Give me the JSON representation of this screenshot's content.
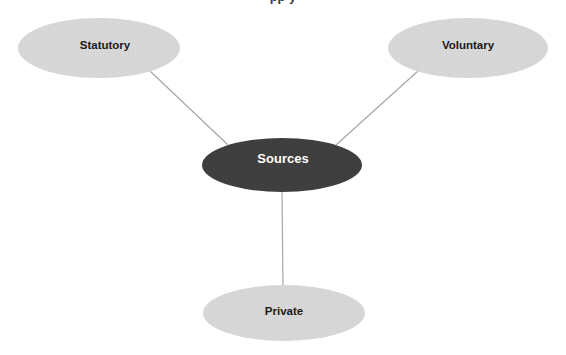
{
  "diagram": {
    "type": "hub-and-spoke",
    "background_color": "#ffffff",
    "clipped_title": "pp y",
    "center_node": {
      "label": "Sources",
      "fill": "#404040",
      "text_color": "#ffffff",
      "cx": 282,
      "cy": 165,
      "rx": 80,
      "ry": 27
    },
    "branch_nodes": [
      {
        "id": "statutory",
        "label": "Statutory",
        "fill": "#d9d9d9",
        "text_color": "#1a1a1a",
        "cx": 99,
        "cy": 48,
        "rx": 81,
        "ry": 30
      },
      {
        "id": "voluntary",
        "label": "Voluntary",
        "fill": "#d9d9d9",
        "text_color": "#1a1a1a",
        "cx": 468,
        "cy": 48,
        "rx": 80,
        "ry": 30
      },
      {
        "id": "private",
        "label": "Private",
        "fill": "#d9d9d9",
        "text_color": "#1a1a1a",
        "cx": 284,
        "cy": 313,
        "rx": 81,
        "ry": 28
      }
    ],
    "connectors": [
      {
        "id": "statutory-to-sources",
        "from": "statutory",
        "to": "center",
        "x1": 150,
        "y1": 71,
        "x2": 228,
        "y2": 145,
        "color": "#a6a6a6",
        "width": 1.2
      },
      {
        "id": "voluntary-to-sources",
        "from": "voluntary",
        "to": "center",
        "x1": 418,
        "y1": 71,
        "x2": 336,
        "y2": 145,
        "color": "#a6a6a6",
        "width": 1.2
      },
      {
        "id": "sources-to-private",
        "from": "center",
        "to": "private",
        "x1": 282,
        "y1": 192,
        "x2": 283,
        "y2": 286,
        "color": "#a6a6a6",
        "width": 1.2
      }
    ],
    "stripe": {
      "color": "#cfcfcf",
      "opacity": 0.55
    }
  }
}
